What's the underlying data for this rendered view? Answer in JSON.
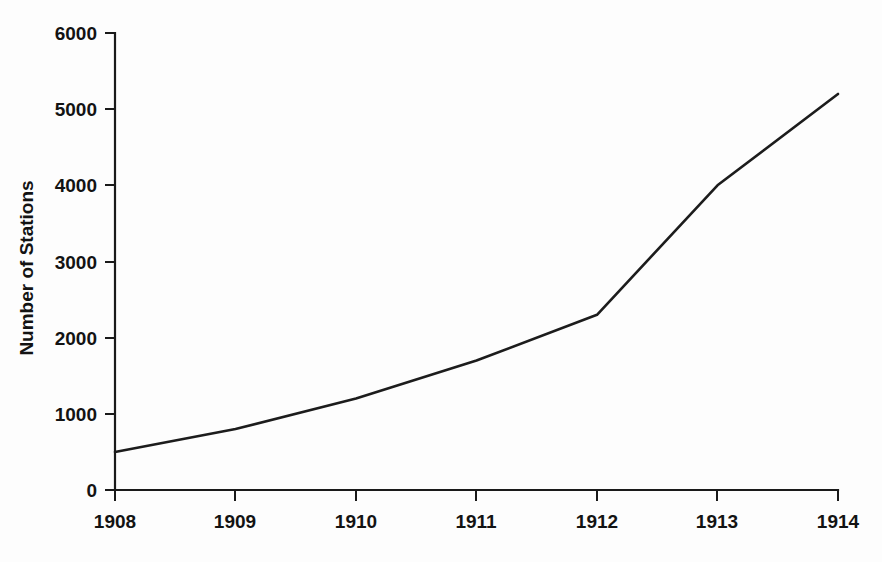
{
  "chart_data": {
    "type": "line",
    "title": "",
    "xlabel": "",
    "ylabel": "Number of Stations",
    "x": [
      1908,
      1909,
      1910,
      1911,
      1912,
      1913,
      1914
    ],
    "xtick_labels": [
      "1908",
      "1909",
      "1910",
      "1911",
      "1912",
      "1913",
      "1914"
    ],
    "values": [
      500,
      800,
      1200,
      1700,
      2300,
      4000,
      5200
    ],
    "series": [
      {
        "name": "Number of Stations",
        "values": [
          500,
          800,
          1200,
          1700,
          2300,
          4000,
          5200
        ]
      }
    ],
    "xlim": [
      1908,
      1914
    ],
    "ylim": [
      0,
      6000
    ],
    "ytick_labels": [
      "0",
      "1000",
      "2000",
      "3000",
      "4000",
      "5000",
      "6000"
    ],
    "yticks": [
      0,
      1000,
      2000,
      3000,
      4000,
      5000,
      6000
    ],
    "grid": false,
    "legend": false,
    "legend_position": "none",
    "markers": false,
    "line_color": "#1c1c1c",
    "background_color": "#fdfdfd",
    "axis_color": "#1a1a1a",
    "spines": [
      "left",
      "bottom"
    ]
  },
  "axis_titles": {
    "y": "Number of Stations"
  }
}
